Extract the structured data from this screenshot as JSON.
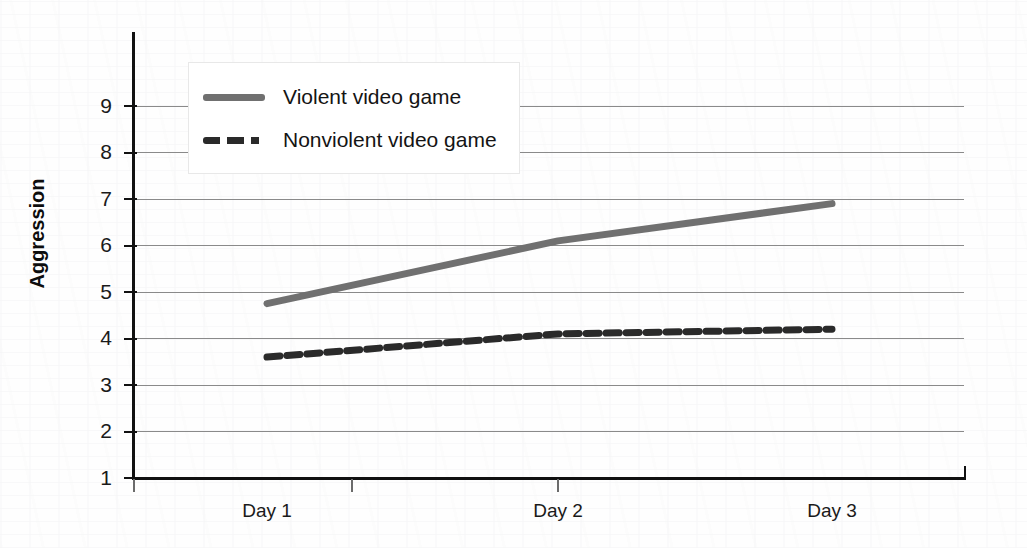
{
  "chart_data": {
    "type": "line",
    "title": "",
    "xlabel": "",
    "ylabel": "Aggression",
    "categories": [
      "Day 1",
      "Day 2",
      "Day 3"
    ],
    "ylim": [
      1,
      9.8
    ],
    "yticks": [
      1,
      2,
      3,
      4,
      5,
      6,
      7,
      8,
      9
    ],
    "grid": true,
    "legend_position": "top-left-inside",
    "series": [
      {
        "name": "Violent video game",
        "values": [
          4.75,
          6.1,
          6.9
        ],
        "style": "solid",
        "color": "#707070"
      },
      {
        "name": "Nonviolent video game",
        "values": [
          3.6,
          4.1,
          4.2
        ],
        "style": "dashed",
        "color": "#2a2a2a"
      }
    ]
  },
  "axis": {
    "y_title": "Aggression",
    "y_tick_labels": [
      "9",
      "8",
      "7",
      "6",
      "5",
      "4",
      "3",
      "2",
      "1"
    ],
    "x_tick_labels": [
      "Day 1",
      "Day 2",
      "Day 3"
    ]
  },
  "legend": {
    "entries": [
      {
        "label": "Violent video game",
        "swatch": "solid-line-swatch"
      },
      {
        "label": "Nonviolent video game",
        "swatch": "dashed-line-swatch"
      }
    ]
  }
}
